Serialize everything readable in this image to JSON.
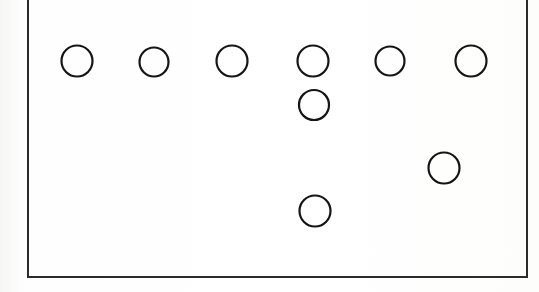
{
  "canvas": {
    "width": 539,
    "height": 292,
    "background_color": "#fdfdfc",
    "description": "Scanned line-drawing diagram: outlined circles arranged inside a rectangular frame"
  },
  "frame": {
    "name": "figure-border",
    "x": 27,
    "y": -4,
    "width": 501,
    "height": 282,
    "stroke_color": "#2b2b2b",
    "stroke_width": 2
  },
  "diagram": {
    "type": "node-layout",
    "shape": "circle",
    "fill": "none",
    "stroke_color": "#151515",
    "stroke_width": 2.2,
    "node_count": 9,
    "rows": [
      {
        "row_label": "top-row",
        "count": 6,
        "center_y": 61
      },
      {
        "row_label": "second-row",
        "count": 1,
        "center_y": 105
      },
      {
        "row_label": "third-row",
        "count": 1,
        "center_y": 168
      },
      {
        "row_label": "bottom-row",
        "count": 1,
        "center_y": 211
      }
    ],
    "nodes": [
      {
        "id": "n1",
        "label": "top-row-1",
        "cx": 77,
        "cy": 61,
        "r": 15.5
      },
      {
        "id": "n2",
        "label": "top-row-2",
        "cx": 154,
        "cy": 62,
        "r": 14.5
      },
      {
        "id": "n3",
        "label": "top-row-3",
        "cx": 232,
        "cy": 61,
        "r": 15.5
      },
      {
        "id": "n4",
        "label": "top-row-4",
        "cx": 313,
        "cy": 61,
        "r": 15.5
      },
      {
        "id": "n5",
        "label": "top-row-5",
        "cx": 390,
        "cy": 61,
        "r": 14.5
      },
      {
        "id": "n6",
        "label": "top-row-6",
        "cx": 471,
        "cy": 61,
        "r": 15.5
      },
      {
        "id": "n7",
        "label": "column-4-second",
        "cx": 314,
        "cy": 105,
        "r": 15
      },
      {
        "id": "n8",
        "label": "right-isolated",
        "cx": 444,
        "cy": 168,
        "r": 15.5
      },
      {
        "id": "n9",
        "label": "column-4-bottom",
        "cx": 315,
        "cy": 211,
        "r": 15.5
      }
    ]
  }
}
